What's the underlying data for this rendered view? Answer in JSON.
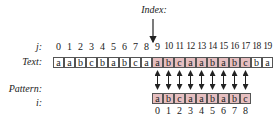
{
  "labels": {
    "index": "Index:",
    "j": "j:",
    "text": "Text:",
    "pattern": "Pattern:",
    "i": "i:"
  },
  "colors": {
    "highlight": "#e6bfc0",
    "border": "#555555"
  },
  "text_row": {
    "j_indices": [
      "0",
      "1",
      "2",
      "3",
      "4",
      "5",
      "6",
      "7",
      "8",
      "9",
      "10",
      "11",
      "12",
      "13",
      "14",
      "15",
      "16",
      "17",
      "18",
      "19"
    ],
    "chars": [
      "a",
      "a",
      "b",
      "c",
      "b",
      "a",
      "b",
      "c",
      "a",
      "a",
      "b",
      "c",
      "a",
      "a",
      "b",
      "a",
      "b",
      "c",
      "b",
      "a"
    ],
    "highlight_start": 9,
    "highlight_end": 17
  },
  "pattern_row": {
    "offset": 9,
    "i_indices": [
      "0",
      "1",
      "2",
      "3",
      "4",
      "5",
      "6",
      "7",
      "8"
    ],
    "chars": [
      "a",
      "b",
      "c",
      "a",
      "a",
      "b",
      "a",
      "b",
      "c"
    ]
  },
  "index_pointer_position": 9
}
